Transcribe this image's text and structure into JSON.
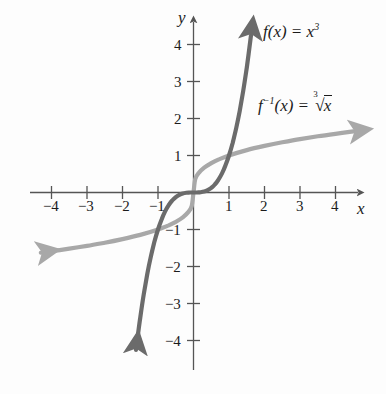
{
  "chart_data": {
    "type": "line",
    "title": "",
    "xlabel": "x",
    "ylabel": "y",
    "xlim": [
      -4.6,
      4.6
    ],
    "ylim": [
      -4.6,
      4.6
    ],
    "grid": false,
    "legend_position": "inside-right",
    "x_ticks": [
      -4,
      -3,
      -2,
      -1,
      1,
      2,
      3,
      4
    ],
    "y_ticks": [
      -4,
      -3,
      -2,
      -1,
      1,
      2,
      3,
      4
    ],
    "x_tick_labels": [
      "−4",
      "−3",
      "−2",
      "−1",
      "1",
      "2",
      "3",
      "4"
    ],
    "y_tick_labels": [
      "−4",
      "−3",
      "−2",
      "−1",
      "1",
      "2",
      "3",
      "4"
    ],
    "series": [
      {
        "name": "f(x) = x^3",
        "color": "#6b6b6b",
        "x": [
          -1.62,
          -1.5,
          -1.4,
          -1.3,
          -1.2,
          -1.1,
          -1.0,
          -0.9,
          -0.8,
          -0.7,
          -0.6,
          -0.5,
          -0.4,
          -0.3,
          -0.2,
          -0.1,
          0,
          0.1,
          0.2,
          0.3,
          0.4,
          0.5,
          0.6,
          0.7,
          0.8,
          0.9,
          1.0,
          1.1,
          1.2,
          1.3,
          1.4,
          1.5,
          1.62
        ],
        "y": [
          -4.25,
          -3.375,
          -2.744,
          -2.197,
          -1.728,
          -1.331,
          -1.0,
          -0.729,
          -0.512,
          -0.343,
          -0.216,
          -0.125,
          -0.064,
          -0.027,
          -0.008,
          -0.001,
          0,
          0.001,
          0.008,
          0.027,
          0.064,
          0.125,
          0.216,
          0.343,
          0.512,
          0.729,
          1.0,
          1.331,
          1.728,
          2.197,
          2.744,
          3.375,
          4.25
        ],
        "arrow_start": true,
        "arrow_end": true
      },
      {
        "name": "f^-1(x) = cuberoot(x)",
        "color": "#a8a8a8",
        "x": [
          -4.3,
          -4.0,
          -3.5,
          -3.0,
          -2.5,
          -2.0,
          -1.5,
          -1.0,
          -0.7,
          -0.5,
          -0.3,
          -0.15,
          -0.05,
          0,
          0.05,
          0.15,
          0.3,
          0.5,
          0.7,
          1.0,
          1.5,
          2.0,
          2.5,
          3.0,
          3.5,
          4.0,
          4.5
        ],
        "y": [
          -1.626,
          -1.587,
          -1.518,
          -1.442,
          -1.357,
          -1.26,
          -1.145,
          -1.0,
          -0.888,
          -0.794,
          -0.669,
          -0.531,
          -0.368,
          0,
          0.368,
          0.531,
          0.669,
          0.794,
          0.888,
          1.0,
          1.145,
          1.26,
          1.357,
          1.442,
          1.518,
          1.587,
          1.65
        ],
        "arrow_start": true,
        "arrow_end": true
      }
    ],
    "annotations": [
      {
        "id": "label-f",
        "text": "f(x) = x³",
        "x": 2.2,
        "y": 4.05
      },
      {
        "id": "label-f-inverse",
        "text": "f⁻¹(x) = ∛x",
        "x": 2.05,
        "y": 2.3
      }
    ]
  },
  "axes": {
    "x_axis_label": "x",
    "y_axis_label": "y",
    "axis_color": "#555555"
  },
  "labels": {
    "f_fn": "f",
    "f_paren_x": "(x)",
    "equals": "=",
    "x_base": "x",
    "cube_exp": "3",
    "inv_exp": "−1",
    "radical_index": "3",
    "radical_sign": "√",
    "radicand": "x"
  },
  "ticks": {
    "x_negative": [
      "−4",
      "−3",
      "−2",
      "−1"
    ],
    "x_positive": [
      "1",
      "2",
      "3",
      "4"
    ],
    "y_positive": [
      "1",
      "2",
      "3",
      "4"
    ],
    "y_negative": [
      "−1",
      "−2",
      "−3",
      "−4"
    ]
  },
  "colors": {
    "background": "#fdfdfd",
    "axis": "#555555",
    "curve_cubic": "#6b6b6b",
    "curve_cuberoot": "#a8a8a8",
    "text": "#1b1b1b"
  }
}
